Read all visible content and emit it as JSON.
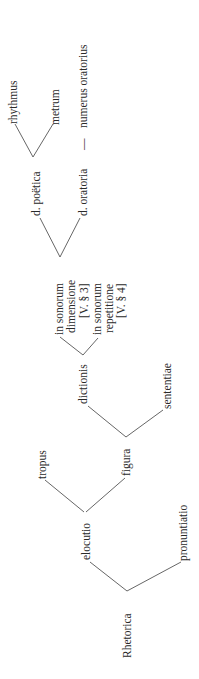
{
  "diagram": {
    "type": "tree",
    "orientation": "rotated-90-ccw",
    "nodes": {
      "rhetorica": "Rhetorica",
      "elocutio": "elocutio",
      "pronuntiatio": "pronuntiatio",
      "tropus": "tropus",
      "figura": "figura",
      "dictionis": "dictionis",
      "sententiae": "sententiae",
      "dimensione": {
        "line1": "in sonorum",
        "line2": "dimensione",
        "line3": "[V. § 3]"
      },
      "repetitione": {
        "line1": "in sonorum",
        "line2": "repetitione",
        "line3": "[V. § 4]"
      },
      "poetica": "d. poëtica",
      "oratoria": "d. oratoria",
      "rhythmus": "rhythmus",
      "metrum": "metrum",
      "dash": "—",
      "numerus": "numerus oratorius"
    },
    "edges": [
      [
        "Rhetorica",
        "elocutio"
      ],
      [
        "Rhetorica",
        "pronuntiatio"
      ],
      [
        "elocutio",
        "tropus"
      ],
      [
        "elocutio",
        "figura"
      ],
      [
        "figura",
        "dictionis"
      ],
      [
        "figura",
        "sententiae"
      ],
      [
        "dictionis",
        "in sonorum dimensione [V. § 3]"
      ],
      [
        "dictionis",
        "in sonorum repetitione [V. § 4]"
      ],
      [
        "in sonorum dimensione [V. § 3]",
        "d. poëtica"
      ],
      [
        "in sonorum dimensione [V. § 3]",
        "d. oratoria"
      ],
      [
        "d. poëtica",
        "rhythmus"
      ],
      [
        "d. poëtica",
        "metrum"
      ],
      [
        "d. oratoria",
        "numerus oratorius"
      ]
    ],
    "colors": {
      "text": "#2a2a2a",
      "lines": "#555555",
      "background": "#ffffff"
    }
  }
}
